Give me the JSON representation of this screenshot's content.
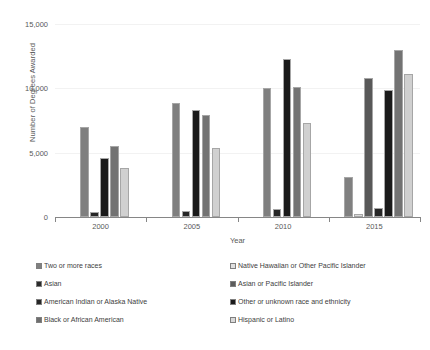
{
  "chart_data": {
    "type": "bar",
    "title": "",
    "xlabel": "Year",
    "ylabel": "Number of Degrees Awarded",
    "categories": [
      "2000",
      "2005",
      "2010",
      "2015"
    ],
    "ylim": [
      0,
      15000
    ],
    "yticks": [
      0,
      5000,
      10000,
      15000
    ],
    "ytick_labels": [
      "0",
      "5,000",
      "10,000",
      "15,000"
    ],
    "grid": true,
    "legend_position": "bottom",
    "series": [
      {
        "name": "Two or more races",
        "color": "#808080",
        "values": [
          null,
          null,
          null,
          3100
        ]
      },
      {
        "name": "Native Hawaiian or Other Pacific Islander",
        "color": "#d9d9d9",
        "values": [
          null,
          null,
          null,
          200
        ]
      },
      {
        "name": "Asian",
        "color": "#7f7f7f",
        "values": [
          7000,
          8900,
          10000,
          null
        ]
      },
      {
        "name": "Asian or Pacific Islander",
        "color": "#595959",
        "values": [
          null,
          null,
          null,
          10800
        ]
      },
      {
        "name": "American Indian or Alaska Native",
        "color": "#262626",
        "values": [
          400,
          500,
          600,
          700
        ]
      },
      {
        "name": "Other or unknown race and ethnicity",
        "color": "#1a1a1a",
        "values": [
          4600,
          8300,
          12300,
          9900
        ]
      },
      {
        "name": "Black or African American",
        "color": "#737373",
        "values": [
          5500,
          7950,
          10100,
          13000
        ]
      },
      {
        "name": "Hispanic or Latino",
        "color": "#d0d0d0",
        "values": [
          3800,
          5400,
          7300,
          11100
        ]
      }
    ]
  },
  "axes": {
    "y_title": "Number of Degrees Awarded",
    "x_title": "Year",
    "y_labels": [
      "15,000",
      "10,000",
      "5,000",
      "0"
    ],
    "x_labels": [
      "2000",
      "2005",
      "2010",
      "2015"
    ]
  },
  "legend": {
    "left_column": [
      {
        "label": "Two or more races",
        "color": "#808080"
      },
      {
        "label": "Asian",
        "color": "#2b2b2b"
      },
      {
        "label": "American Indian or Alaska Native",
        "color": "#262626"
      },
      {
        "label": "Black or African American",
        "color": "#6e6e6e"
      }
    ],
    "right_column": [
      {
        "label": "Native Hawaiian or Other Pacific Islander",
        "color": "#e0e0e0"
      },
      {
        "label": "Asian or Pacific Islander",
        "color": "#5c5c5c"
      },
      {
        "label": "Other or unknown race and ethnicity",
        "color": "#1a1a1a"
      },
      {
        "label": "Hispanic or Latino",
        "color": "#d9d9d9"
      }
    ]
  }
}
